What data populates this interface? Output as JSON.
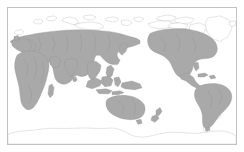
{
  "figure": {
    "type": "thematic-world-map",
    "projection": "pacific-centered equirectangular",
    "frame_color": "#c2c2c2",
    "background_color": "#ffffff"
  },
  "legend_colors": {
    "shaded_land_fill": "#a9a9a9",
    "shaded_land_stroke": "#8f8f8f",
    "unshaded_land_fill": "#ffffff",
    "unshaded_land_stroke": "#b4b4b4",
    "internal_border_stroke": "#8a8a8a"
  },
  "map_regions": {
    "shaded": [
      {
        "name": "Europe",
        "id": "europe"
      },
      {
        "name": "Africa",
        "id": "africa"
      },
      {
        "name": "Madagascar",
        "id": "madagascar"
      },
      {
        "name": "Asia",
        "id": "asia"
      },
      {
        "name": "Arabian Peninsula",
        "id": "arabia"
      },
      {
        "name": "Indian Subcontinent",
        "id": "india"
      },
      {
        "name": "Southeast Asia",
        "id": "southeast-asia"
      },
      {
        "name": "Indonesia",
        "id": "indonesia"
      },
      {
        "name": "Borneo",
        "id": "borneo"
      },
      {
        "name": "Sulawesi",
        "id": "sulawesi"
      },
      {
        "name": "New Guinea",
        "id": "new-guinea"
      },
      {
        "name": "Japan",
        "id": "japan"
      },
      {
        "name": "Philippines",
        "id": "philippines"
      },
      {
        "name": "Sri Lanka",
        "id": "sri-lanka"
      },
      {
        "name": "Australia",
        "id": "australia"
      },
      {
        "name": "Tasmania",
        "id": "tasmania"
      },
      {
        "name": "New Zealand",
        "id": "new-zealand"
      },
      {
        "name": "North America",
        "id": "north-america"
      },
      {
        "name": "Central America",
        "id": "central-america"
      },
      {
        "name": "Cuba",
        "id": "cuba"
      },
      {
        "name": "South America",
        "id": "south-america"
      },
      {
        "name": "British Isles",
        "id": "british-isles"
      }
    ],
    "unshaded": [
      {
        "name": "Greenland",
        "id": "greenland"
      },
      {
        "name": "Canadian Arctic Archipelago",
        "id": "canadian-arctic"
      },
      {
        "name": "Baffin Island",
        "id": "baffin-island"
      },
      {
        "name": "Svalbard",
        "id": "svalbard"
      },
      {
        "name": "Novaya Zemlya",
        "id": "novaya-zemlya"
      },
      {
        "name": "Severnaya Zemlya",
        "id": "severnaya-zemlya"
      },
      {
        "name": "New Siberian Islands",
        "id": "new-siberian-islands"
      },
      {
        "name": "Iceland",
        "id": "iceland"
      },
      {
        "name": "Alaska North Slope",
        "id": "alaska-north"
      },
      {
        "name": "Antarctica",
        "id": "antarctica"
      }
    ]
  }
}
